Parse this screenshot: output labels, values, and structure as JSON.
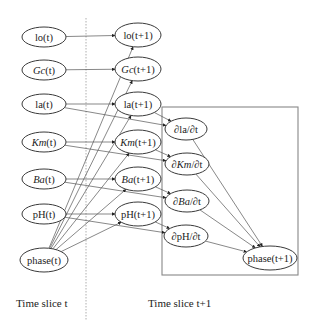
{
  "diagram": {
    "type": "dynamic-bayesian-network",
    "slices": [
      {
        "label": "Time slice t",
        "x": 16,
        "y": 297
      },
      {
        "label": "Time slice t+1",
        "x": 148,
        "y": 297
      }
    ],
    "divider_x": 86,
    "derivative_box": {
      "x": 162,
      "y": 107,
      "w": 136,
      "h": 168
    },
    "nodes": [
      {
        "id": "lo_t",
        "label": "lo(t)",
        "italic": "",
        "x": 44,
        "y": 37,
        "rx": 22,
        "ry": 10
      },
      {
        "id": "gc_t",
        "label": "Gc(t)",
        "italic": "Gc",
        "x": 44,
        "y": 70,
        "rx": 22,
        "ry": 10
      },
      {
        "id": "la_t",
        "label": "la(t)",
        "italic": "",
        "x": 44,
        "y": 104,
        "rx": 22,
        "ry": 10
      },
      {
        "id": "km_t",
        "label": "Km(t)",
        "italic": "Km",
        "x": 44,
        "y": 142,
        "rx": 22,
        "ry": 10
      },
      {
        "id": "ba_t",
        "label": "Ba(t)",
        "italic": "Ba",
        "x": 44,
        "y": 179,
        "rx": 22,
        "ry": 10
      },
      {
        "id": "ph_t",
        "label": "pH(t)",
        "italic": "",
        "x": 44,
        "y": 214,
        "rx": 22,
        "ry": 10
      },
      {
        "id": "phase_t",
        "label": "phase(t)",
        "italic": "",
        "x": 44,
        "y": 260,
        "rx": 24,
        "ry": 12
      },
      {
        "id": "lo_t1",
        "label": "lo(t+1)",
        "italic": "",
        "x": 138,
        "y": 35,
        "rx": 23,
        "ry": 12
      },
      {
        "id": "gc_t1",
        "label": "Gc(t+1)",
        "italic": "Gc",
        "x": 138,
        "y": 69,
        "rx": 23,
        "ry": 12
      },
      {
        "id": "la_t1",
        "label": "la(t+1)",
        "italic": "",
        "x": 138,
        "y": 104,
        "rx": 23,
        "ry": 12
      },
      {
        "id": "km_t1",
        "label": "Km(t+1)",
        "italic": "Km",
        "x": 138,
        "y": 142,
        "rx": 23,
        "ry": 12
      },
      {
        "id": "ba_t1",
        "label": "Ba(t+1)",
        "italic": "Ba",
        "x": 138,
        "y": 179,
        "rx": 23,
        "ry": 12
      },
      {
        "id": "ph_t1",
        "label": "pH(t+1)",
        "italic": "",
        "x": 138,
        "y": 214,
        "rx": 23,
        "ry": 12
      },
      {
        "id": "dla",
        "label": "∂la/∂t",
        "italic": "",
        "x": 186,
        "y": 129,
        "rx": 21,
        "ry": 11
      },
      {
        "id": "dkm",
        "label": "∂Km/∂t",
        "italic": "Km",
        "x": 187,
        "y": 164,
        "rx": 22,
        "ry": 11
      },
      {
        "id": "dba",
        "label": "∂Ba/∂t",
        "italic": "Ba",
        "x": 187,
        "y": 201,
        "rx": 22,
        "ry": 11
      },
      {
        "id": "dph",
        "label": "∂pH/∂t",
        "italic": "",
        "x": 186,
        "y": 236,
        "rx": 22,
        "ry": 11
      },
      {
        "id": "phase_t1",
        "label": "phase(t+1)",
        "italic": "",
        "x": 270,
        "y": 258,
        "rx": 27,
        "ry": 12
      }
    ],
    "edges": [
      [
        "lo_t",
        "lo_t1"
      ],
      [
        "gc_t",
        "gc_t1"
      ],
      [
        "la_t",
        "la_t1"
      ],
      [
        "km_t",
        "km_t1"
      ],
      [
        "ba_t",
        "ba_t1"
      ],
      [
        "ph_t",
        "ph_t1"
      ],
      [
        "la_t",
        "dla"
      ],
      [
        "km_t",
        "dkm"
      ],
      [
        "ba_t",
        "dba"
      ],
      [
        "ph_t",
        "dph"
      ],
      [
        "la_t1",
        "dla"
      ],
      [
        "km_t1",
        "dkm"
      ],
      [
        "ba_t1",
        "dba"
      ],
      [
        "ph_t1",
        "dph"
      ],
      [
        "phase_t",
        "lo_t1"
      ],
      [
        "phase_t",
        "gc_t1"
      ],
      [
        "phase_t",
        "la_t1"
      ],
      [
        "phase_t",
        "km_t1"
      ],
      [
        "phase_t",
        "ba_t1"
      ],
      [
        "phase_t",
        "ph_t1"
      ],
      [
        "dla",
        "phase_t1"
      ],
      [
        "dkm",
        "phase_t1"
      ],
      [
        "dba",
        "phase_t1"
      ],
      [
        "dph",
        "phase_t1"
      ]
    ]
  }
}
